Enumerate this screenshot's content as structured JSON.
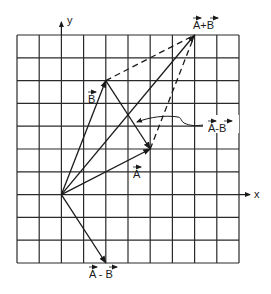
{
  "diagram": {
    "type": "vector-addition-subtraction",
    "grid": {
      "columns": 10,
      "rows": 10,
      "origin_cell": [
        2,
        7
      ]
    },
    "axes": {
      "x_label": "x",
      "y_label": "y"
    },
    "vectors": [
      {
        "id": "A",
        "label": "A",
        "components": [
          4,
          2
        ],
        "from": "origin",
        "style": "solid"
      },
      {
        "id": "B",
        "label": "B",
        "components": [
          2,
          5
        ],
        "from": "origin",
        "style": "solid"
      },
      {
        "id": "A_plus_B",
        "label": "A+B",
        "components": [
          6,
          7
        ],
        "from": "origin",
        "style": "solid"
      },
      {
        "id": "A_minus_B",
        "label": "A - B",
        "components": [
          2,
          -3
        ],
        "from": "origin",
        "style": "solid"
      },
      {
        "id": "A_minus_B_translated",
        "label": "A-B",
        "components": [
          2,
          -3
        ],
        "from": "tip of B",
        "style": "solid",
        "note": "indicated by curved leader arrow"
      }
    ],
    "construction_lines": [
      {
        "from": "tip of B",
        "to": "tip of A+B",
        "style": "dashed"
      },
      {
        "from": "tip of A",
        "to": "tip of A+B",
        "style": "dashed"
      }
    ],
    "labels": {
      "a": "A",
      "b": "B",
      "sum": "A+B",
      "diff_leader": "A-B",
      "diff_bottom": "A - B",
      "x": "x",
      "y": "y"
    },
    "colors": {
      "ink": "#1a1a1a",
      "background": "#ffffff"
    }
  }
}
